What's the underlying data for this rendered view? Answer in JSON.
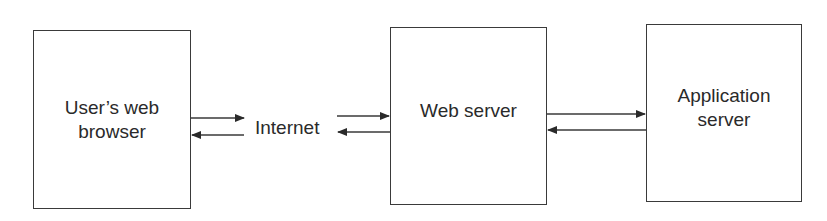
{
  "diagram": {
    "nodes": [
      {
        "id": "browser",
        "label": "User’s web\nbrowser"
      },
      {
        "id": "internet",
        "label": "Internet"
      },
      {
        "id": "webserver",
        "label": "Web server"
      },
      {
        "id": "appserver",
        "label": "Application\nserver"
      }
    ],
    "edges": [
      {
        "from": "browser",
        "to": "internet",
        "direction": "right"
      },
      {
        "from": "internet",
        "to": "browser",
        "direction": "left"
      },
      {
        "from": "internet",
        "to": "webserver",
        "direction": "right"
      },
      {
        "from": "webserver",
        "to": "internet",
        "direction": "left"
      },
      {
        "from": "webserver",
        "to": "appserver",
        "direction": "right"
      },
      {
        "from": "appserver",
        "to": "webserver",
        "direction": "left"
      }
    ]
  }
}
